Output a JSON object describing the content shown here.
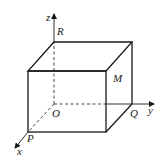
{
  "figure": {
    "type": "3d-rectangular-box-with-axes",
    "labels": {
      "z_axis": "z",
      "y_axis": "y",
      "x_axis": "x",
      "origin": "O",
      "point_R": "R",
      "point_M": "M",
      "point_Q": "Q",
      "point_P": "P"
    },
    "colors": {
      "line": "#1a1a1a",
      "background": "#ffffff"
    }
  }
}
